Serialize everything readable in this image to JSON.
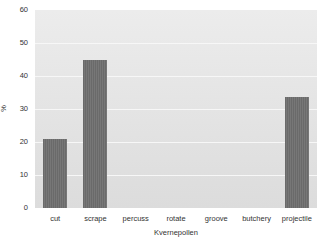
{
  "chart_data": {
    "type": "bar",
    "title": "",
    "xlabel": "Kvernepollen",
    "ylabel": "%",
    "categories": [
      "cut",
      "scrape",
      "percuss",
      "rotate",
      "groove",
      "butchery",
      "projectile"
    ],
    "values": [
      21,
      45,
      0,
      0,
      0,
      0,
      33.5
    ],
    "ylim": [
      0,
      60
    ],
    "yticks": [
      0,
      10,
      20,
      30,
      40,
      50,
      60
    ],
    "grid": true,
    "legend": null,
    "colors": {
      "bar": "#707070",
      "plot_background": "#e4e4e4",
      "gridline": "#f7f7f7"
    }
  }
}
